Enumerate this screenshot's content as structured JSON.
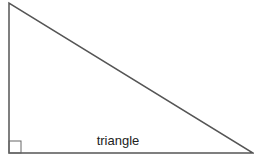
{
  "diagram": {
    "type": "right-triangle",
    "label": "triangle",
    "right_angle_marker": true,
    "right_angle_corner": "bottom-left",
    "stroke_color": "#555555",
    "background_color": "#ffffff"
  }
}
